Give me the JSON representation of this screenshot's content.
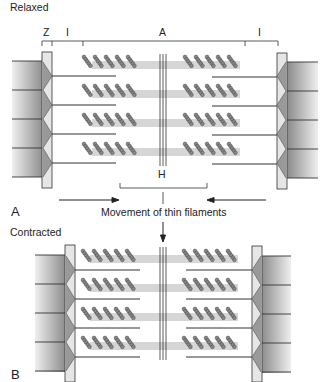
{
  "panels": {
    "relaxed": {
      "title": "Relaxed",
      "panel_letter": "A",
      "band_labels": {
        "z": "Z",
        "i_left": "I",
        "a": "A",
        "i_right": "I",
        "h": "H"
      }
    },
    "contracted": {
      "title": "Contracted",
      "panel_letter": "B"
    }
  },
  "annotation": {
    "movement_label": "Movement of thin filaments"
  },
  "colors": {
    "line": "#2a2a2a",
    "zdisc_fill": "#e6e6e6",
    "myosin_head": "#7a7a7a",
    "myofibril_dark": "#8c8c8c",
    "myofibril_light": "#efefef"
  }
}
